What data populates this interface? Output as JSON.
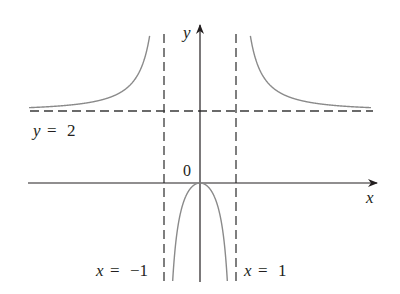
{
  "figure": {
    "function": "y = 2x^2 / (x^2 - 1)",
    "axes": {
      "x_label": "x",
      "y_label": "y",
      "origin_label": "0"
    },
    "asymptotes": {
      "horizontal": {
        "label_var": "y",
        "label_eq": "=",
        "label_val": "2",
        "value": 2
      },
      "vertical_left": {
        "label_var": "x",
        "label_eq": "=",
        "label_val": "−1",
        "value": -1
      },
      "vertical_right": {
        "label_var": "x",
        "label_eq": "=",
        "label_val": "1",
        "value": 1
      }
    },
    "colors": {
      "axis": "#231f20",
      "curve": "#8a8a8a",
      "asymptote": "#3a3a3a"
    }
  }
}
